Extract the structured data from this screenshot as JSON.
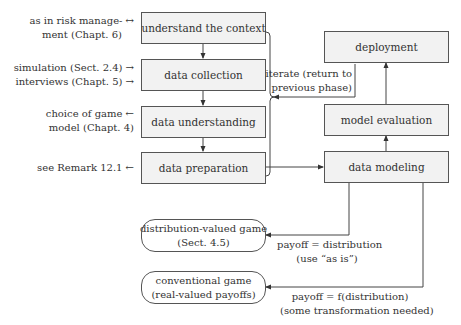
{
  "process": {
    "left_phases": [
      {
        "label": "understand the context"
      },
      {
        "label": "data collection"
      },
      {
        "label": "data understanding"
      },
      {
        "label": "data preparation"
      }
    ],
    "right_phases": [
      {
        "label": "deployment"
      },
      {
        "label": "model evaluation"
      },
      {
        "label": "data modeling"
      }
    ]
  },
  "annotations": {
    "context": {
      "line1": "as in risk manage- ↔",
      "line2": "ment (Chapt. 6)"
    },
    "collection": {
      "line1": "simulation (Sect. 2.4) →",
      "line2": "interviews (Chapt. 5) →"
    },
    "understanding": {
      "line1": "choice of game ←",
      "line2": "model (Chapt. 4)"
    },
    "preparation": {
      "line1": "see Remark 12.1 ←"
    },
    "iterate": {
      "line1": "iterate (return to",
      "line2": "previous phase)"
    }
  },
  "outcomes": [
    {
      "line1": "distribution-valued game",
      "line2": "(Sect. 4.5)",
      "edge_line1": "payoff = distribution",
      "edge_line2": "(use “as is”)"
    },
    {
      "line1": "conventional game",
      "line2": "(real-valued payoffs)",
      "edge_line1": "payoff = f(distribution)",
      "edge_line2": "(some transformation needed)"
    }
  ],
  "colors": {
    "box_fill": "#f2f2f2",
    "stroke": "#555555",
    "text": "#333333"
  }
}
